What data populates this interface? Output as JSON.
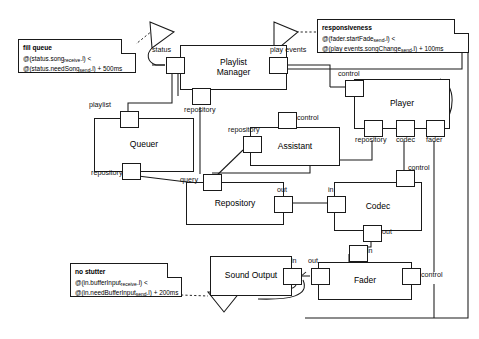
{
  "diagram": {
    "type": "uml-component-diagram",
    "canvas": {
      "width": 479,
      "height": 339
    },
    "line_color": "#1a1a1a",
    "background": "#ffffff"
  },
  "components": [
    {
      "id": "playlist_manager",
      "label": "Playlist\nManager"
    },
    {
      "id": "player",
      "label": "Player"
    },
    {
      "id": "queuer",
      "label": "Queuer"
    },
    {
      "id": "assistant",
      "label": "Assistant"
    },
    {
      "id": "repository",
      "label": "Repository"
    },
    {
      "id": "codec",
      "label": "Codec"
    },
    {
      "id": "sound_output",
      "label": "Sound Output"
    },
    {
      "id": "fader",
      "label": "Fader"
    }
  ],
  "ports": {
    "pm_status": "status",
    "pm_play_events": "play events",
    "pm_repository": "repository",
    "player_control": "control",
    "player_repository": "repository",
    "player_codec": "codec",
    "player_fader": "fader",
    "queuer_playlist": "playlist",
    "queuer_repository": "repository",
    "assistant_repository": "repository",
    "assistant_control": "control",
    "repo_query": "query",
    "repo_out": "out",
    "codec_in": "in",
    "codec_control": "control",
    "codec_out": "out",
    "sound_in": "in",
    "fader_out": "out",
    "fader_in": "in",
    "fader_control": "control"
  },
  "notes": [
    {
      "id": "fill_queue",
      "title": "fill queue",
      "lines": [
        "@(status.song_receive.l) <",
        "@(status.needSong_send.l) + 500ms"
      ],
      "line1": {
        "prefix": "@(status.song",
        "sub": "receive",
        "suffix": ".l) <"
      },
      "line2": {
        "prefix": "@(status.needSong",
        "sub": "send",
        "suffix": ".l) + 500ms"
      }
    },
    {
      "id": "responsiveness",
      "title": "responsiveness",
      "lines": [
        "@(fader.startFade_send.l) <",
        "@(play events.songChange_send.l) + 100ms"
      ],
      "line1": {
        "prefix": "@(fader.startFade",
        "sub": "send",
        "suffix": ".l) <"
      },
      "line2": {
        "prefix": "@(play events.songChange",
        "sub": "send",
        "suffix": ".l) + 100ms"
      }
    },
    {
      "id": "no_stutter",
      "title": "no stutter",
      "lines": [
        "@(in.bufferInput_receive.l) <",
        "@(in.needBufferInput_send.l) + 200ms"
      ],
      "line1": {
        "prefix": "@(in.bufferInput",
        "sub": "receive",
        "suffix": ".l) <"
      },
      "line2": {
        "prefix": "@(in.needBufferInput",
        "sub": "send",
        "suffix": ".l) + 200ms"
      }
    }
  ],
  "constraint_markers": [
    {
      "id": "marker_top",
      "shape": "triangle",
      "attached_note": "fill queue"
    },
    {
      "id": "marker_upper_right",
      "shape": "triangle",
      "attached_note": "responsiveness"
    },
    {
      "id": "marker_bottom",
      "shape": "triangle",
      "attached_note": "no stutter"
    }
  ]
}
